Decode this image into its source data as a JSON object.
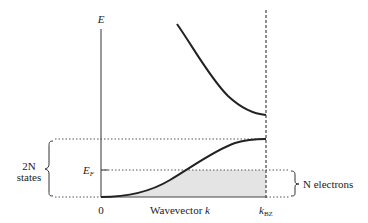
{
  "diagram": {
    "type": "band-structure",
    "axes": {
      "y_label": "E",
      "x_label_prefix": "Wavevector ",
      "x_label_var": "k",
      "x_origin": "0",
      "x_end_main": "k",
      "x_end_sub": "BZ"
    },
    "levels": {
      "fermi_main": "E",
      "fermi_sub": "F"
    },
    "annotations": {
      "left_brace_line1": "2N",
      "left_brace_line2": "states",
      "right_brace": "N electrons"
    },
    "colors": {
      "curve": "#222222",
      "axis": "#555555",
      "fill": "#e4e4e4",
      "dotted": "#555555"
    }
  }
}
